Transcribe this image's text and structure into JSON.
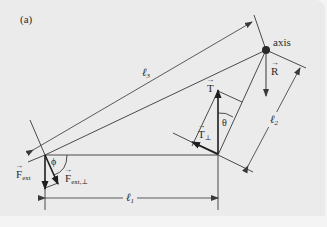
{
  "figure": {
    "panel_label": "(a)",
    "background": "#ebebeb",
    "line_color": "#555555",
    "arrow_color": "#2a2a2a"
  },
  "labels": {
    "axis": "axis",
    "l1": {
      "sym": "ℓ",
      "sub": "1"
    },
    "l2": {
      "sym": "ℓ",
      "sub": "2"
    },
    "l3": {
      "sym": "ℓ",
      "sub": "3"
    },
    "R": "R",
    "T": "T",
    "T_perp": {
      "sym": "T",
      "sub": "⊥"
    },
    "theta": "θ",
    "phi": "ϕ",
    "F_ext": {
      "sym": "F",
      "sub": "ext"
    },
    "F_ext_perp": {
      "sym": "F",
      "sub": "ext,⊥"
    }
  }
}
